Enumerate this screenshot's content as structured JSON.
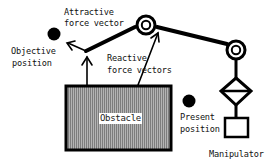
{
  "diagram": {
    "type": "potential-field manipulator diagram",
    "labels": {
      "attractive_line1": "Attractive",
      "attractive_line2": "force vector",
      "objective_line1": "Objective",
      "objective_line2": "position",
      "reactive_line1": "Reactive",
      "reactive_line2": "force vectors",
      "obstacle": "Obstacle",
      "present_line1": "Present",
      "present_line2": "position",
      "manipulator": "Manipulator"
    },
    "nodes": [
      {
        "id": "objective-position",
        "shape": "filled-circle"
      },
      {
        "id": "present-position",
        "shape": "filled-circle"
      },
      {
        "id": "joint-1",
        "shape": "double-circle"
      },
      {
        "id": "joint-2",
        "shape": "double-circle"
      },
      {
        "id": "end-effector",
        "shape": "arm-tip"
      },
      {
        "id": "obstacle",
        "shape": "hatched-rectangle"
      },
      {
        "id": "wrist",
        "shape": "diamond-with-bar"
      },
      {
        "id": "base",
        "shape": "rectangle"
      }
    ],
    "edges": [
      {
        "from": "end-effector",
        "to": "joint-1",
        "kind": "link"
      },
      {
        "from": "joint-1",
        "to": "joint-2",
        "kind": "link"
      },
      {
        "from": "joint-2",
        "to": "wrist",
        "kind": "link"
      },
      {
        "from": "wrist",
        "to": "base",
        "kind": "link"
      },
      {
        "from": "end-effector",
        "to": "objective-position",
        "kind": "attractive-force-arrow"
      },
      {
        "from": "obstacle",
        "to": "end-effector",
        "kind": "reactive-force-arrow"
      },
      {
        "from": "obstacle",
        "to": "joint-1",
        "kind": "reactive-force-arrow"
      }
    ],
    "colors": {
      "ink": "#000000",
      "obstacle_fill": "#9a9a9a",
      "background": "#ffffff"
    }
  }
}
